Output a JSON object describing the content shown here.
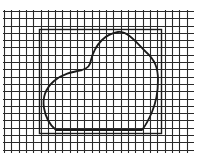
{
  "diagram": {
    "type": "area-estimation-grid",
    "width": 197,
    "height": 155,
    "background": "#ffffff",
    "grid": {
      "x0": 4,
      "y0": 11,
      "x1": 193,
      "y1": 152,
      "step": 7.3,
      "color": "#2a2a2a",
      "stroke_width": 1.1
    },
    "rectangle": {
      "x": 39,
      "y": 29,
      "width": 122,
      "height": 104,
      "color": "#1a1a1a",
      "stroke_width": 1.4
    },
    "blob": {
      "color": "#1a1a1a",
      "stroke_width": 1.8,
      "path": "M118,32 C128,31 136,42 146,52 C155,60 158,68 158,80 C158,92 157,100 152,112 C149,119 146,125 142,130 L56,130 C51,126 46,120 44,108 C42,96 46,88 54,81 C62,74 72,72 82,70 C88,68 90,66 91,60 C93,52 96,46 102,40 C107,35 112,33 118,32 Z"
    }
  }
}
